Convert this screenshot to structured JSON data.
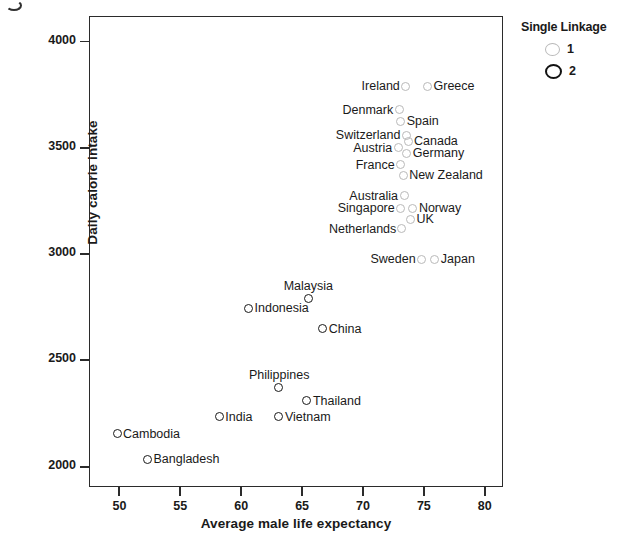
{
  "chart_data": {
    "type": "scatter",
    "title": "",
    "xlabel": "Average male life expectancy",
    "ylabel": "Daily calorie intake",
    "xlim": [
      47.5,
      81.5
    ],
    "ylim": [
      1905,
      4120
    ],
    "xticks": [
      50,
      55,
      60,
      65,
      70,
      75,
      80
    ],
    "yticks": [
      2000,
      2500,
      3000,
      3500,
      4000
    ],
    "grid": false,
    "legend": {
      "title": "Single Linkage",
      "position": "top-right",
      "entries": [
        {
          "label": "1",
          "color": "#b9b9b9",
          "style": "open-circle-light"
        },
        {
          "label": "2",
          "color": "#121212",
          "style": "open-circle-bold"
        }
      ]
    },
    "points": [
      {
        "name": "Ireland",
        "x": 73.5,
        "y": 3790,
        "cluster": 1,
        "label_pos": "left"
      },
      {
        "name": "Greece",
        "x": 75.3,
        "y": 3790,
        "cluster": 1,
        "label_pos": "right"
      },
      {
        "name": "Denmark",
        "x": 73.0,
        "y": 3680,
        "cluster": 1,
        "label_pos": "left"
      },
      {
        "name": "Spain",
        "x": 73.1,
        "y": 3625,
        "cluster": 1,
        "label_pos": "right"
      },
      {
        "name": "Switzerland",
        "x": 73.6,
        "y": 3560,
        "cluster": 1,
        "label_pos": "left"
      },
      {
        "name": "Canada",
        "x": 73.7,
        "y": 3530,
        "cluster": 1,
        "label_pos": "right"
      },
      {
        "name": "Austria",
        "x": 72.9,
        "y": 3500,
        "cluster": 1,
        "label_pos": "left"
      },
      {
        "name": "Germany",
        "x": 73.6,
        "y": 3475,
        "cluster": 1,
        "label_pos": "right"
      },
      {
        "name": "France",
        "x": 73.1,
        "y": 3420,
        "cluster": 1,
        "label_pos": "left"
      },
      {
        "name": "New Zealand",
        "x": 73.3,
        "y": 3370,
        "cluster": 1,
        "label_pos": "right"
      },
      {
        "name": "Australia",
        "x": 73.4,
        "y": 3275,
        "cluster": 1,
        "label_pos": "left"
      },
      {
        "name": "Norway",
        "x": 74.1,
        "y": 3215,
        "cluster": 1,
        "label_pos": "right"
      },
      {
        "name": "Singapore",
        "x": 73.1,
        "y": 3215,
        "cluster": 1,
        "label_pos": "left"
      },
      {
        "name": "UK",
        "x": 73.9,
        "y": 3165,
        "cluster": 1,
        "label_pos": "right"
      },
      {
        "name": "Netherlands",
        "x": 73.2,
        "y": 3120,
        "cluster": 1,
        "label_pos": "left"
      },
      {
        "name": "Sweden",
        "x": 74.8,
        "y": 2975,
        "cluster": 1,
        "label_pos": "left"
      },
      {
        "name": "Japan",
        "x": 75.9,
        "y": 2975,
        "cluster": 1,
        "label_pos": "right"
      },
      {
        "name": "Malaysia",
        "x": 65.5,
        "y": 2790,
        "cluster": 2,
        "label_pos": "top"
      },
      {
        "name": "Indonesia",
        "x": 60.6,
        "y": 2745,
        "cluster": 2,
        "label_pos": "right"
      },
      {
        "name": "China",
        "x": 66.7,
        "y": 2650,
        "cluster": 2,
        "label_pos": "right"
      },
      {
        "name": "Philippines",
        "x": 63.1,
        "y": 2375,
        "cluster": 2,
        "label_pos": "top"
      },
      {
        "name": "Thailand",
        "x": 65.4,
        "y": 2310,
        "cluster": 2,
        "label_pos": "right"
      },
      {
        "name": "India",
        "x": 58.2,
        "y": 2235,
        "cluster": 2,
        "label_pos": "right"
      },
      {
        "name": "Vietnam",
        "x": 63.1,
        "y": 2235,
        "cluster": 2,
        "label_pos": "right"
      },
      {
        "name": "Cambodia",
        "x": 49.8,
        "y": 2155,
        "cluster": 2,
        "label_pos": "right"
      },
      {
        "name": "Bangladesh",
        "x": 52.3,
        "y": 2035,
        "cluster": 2,
        "label_pos": "right"
      }
    ]
  }
}
